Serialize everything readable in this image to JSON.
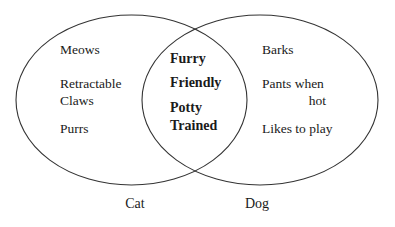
{
  "diagram": {
    "type": "venn",
    "sets": [
      {
        "id": "cat",
        "label": "Cat",
        "items": [
          "Meows",
          "Retractable",
          "Claws",
          "Purrs"
        ]
      },
      {
        "id": "dog",
        "label": "Dog",
        "items": [
          "Barks",
          "Pants when",
          "hot",
          "Likes to play"
        ]
      }
    ],
    "intersection": {
      "items": [
        "Furry",
        "Friendly",
        "Potty",
        "Trained"
      ]
    },
    "colors": {
      "stroke": "#333333",
      "background": "#ffffff",
      "text": "#1a1a1a"
    }
  }
}
